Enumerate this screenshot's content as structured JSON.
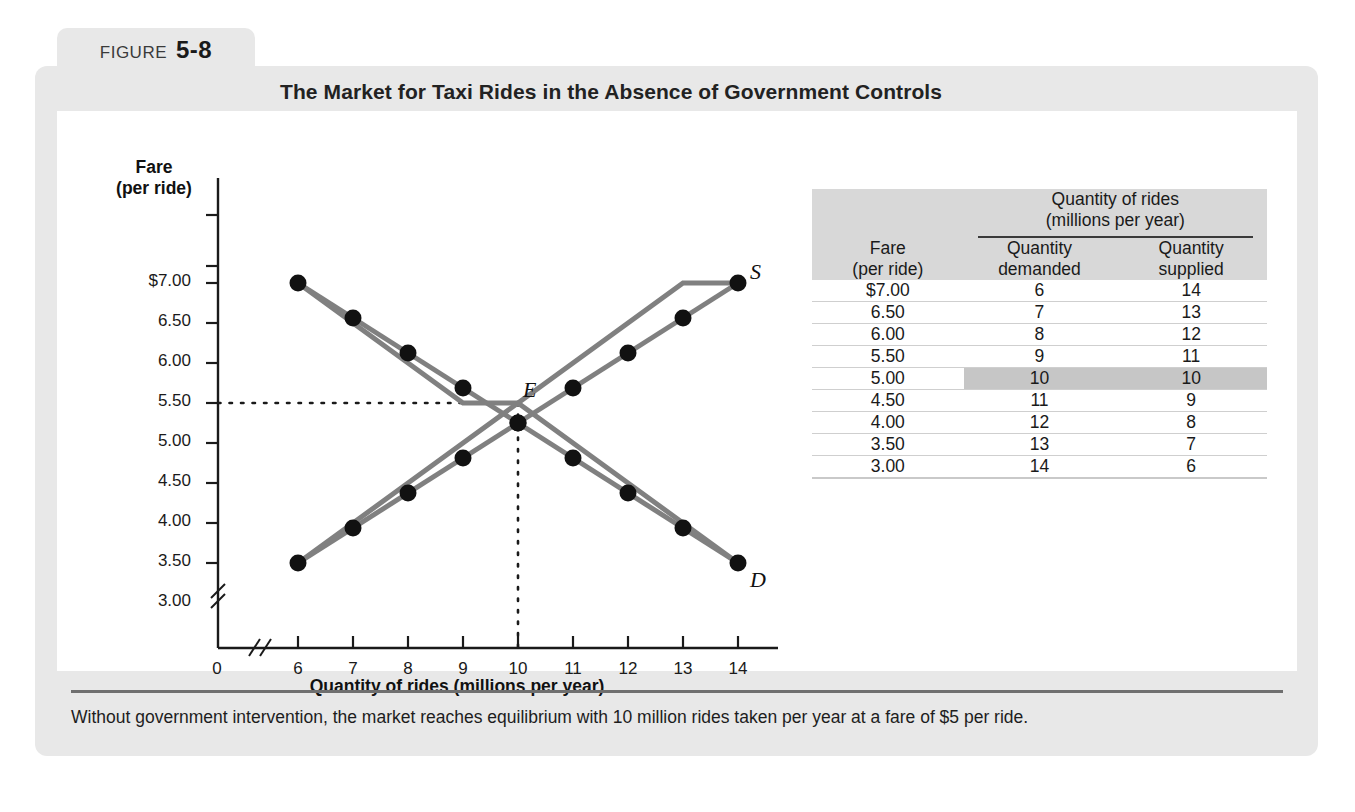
{
  "figure": {
    "label": "FIGURE",
    "number": "5-8",
    "title": "The Market for Taxi Rides in the Absence of Government Controls",
    "caption": "Without government intervention, the market reaches equilibrium with 10 million rides taken per year at a fare of $5 per ride."
  },
  "table": {
    "headers": {
      "fare_line1": "Fare",
      "fare_line2": "(per ride)",
      "group_line1": "Quantity of rides",
      "group_line2": "(millions per year)",
      "demanded_line1": "Quantity",
      "demanded_line2": "demanded",
      "supplied_line1": "Quantity",
      "supplied_line2": "supplied"
    },
    "rows": [
      {
        "fare": "$7.00",
        "demanded": "6",
        "supplied": "14",
        "highlight": false
      },
      {
        "fare": "6.50",
        "demanded": "7",
        "supplied": "13",
        "highlight": false
      },
      {
        "fare": "6.00",
        "demanded": "8",
        "supplied": "12",
        "highlight": false
      },
      {
        "fare": "5.50",
        "demanded": "9",
        "supplied": "11",
        "highlight": false
      },
      {
        "fare": "5.00",
        "demanded": "10",
        "supplied": "10",
        "highlight": true
      },
      {
        "fare": "4.50",
        "demanded": "11",
        "supplied": "9",
        "highlight": false
      },
      {
        "fare": "4.00",
        "demanded": "12",
        "supplied": "8",
        "highlight": false
      },
      {
        "fare": "3.50",
        "demanded": "13",
        "supplied": "7",
        "highlight": false
      },
      {
        "fare": "3.00",
        "demanded": "14",
        "supplied": "6",
        "highlight": false
      }
    ],
    "highlight_color": "#c6c6c6",
    "header_bg": "#d8d8d8"
  },
  "chart_data": {
    "type": "line",
    "title": "The Market for Taxi Rides in the Absence of Government Controls",
    "xlabel": "Quantity of rides (millions per year)",
    "ylabel_line1": "Fare",
    "ylabel_line2": "(per ride)",
    "origin_label": "0",
    "categories": [
      "6",
      "7",
      "8",
      "9",
      "10",
      "11",
      "12",
      "13",
      "14"
    ],
    "x": [
      6,
      7,
      8,
      9,
      10,
      11,
      12,
      13,
      14
    ],
    "ytick_labels": [
      "$7.00",
      "6.50",
      "6.00",
      "5.50",
      "5.00",
      "4.50",
      "4.00",
      "3.50",
      "3.00"
    ],
    "ylim": [
      3.0,
      7.0
    ],
    "xlim": [
      6,
      14
    ],
    "grid": false,
    "axis_break_x": true,
    "axis_break_y": true,
    "legend_position": "inline-curve-labels",
    "series": [
      {
        "name": "Demand",
        "label": "D",
        "color": "#808080",
        "marker_color": "#111111",
        "x": [
          6,
          7,
          8,
          9,
          10,
          11,
          12,
          13,
          14
        ],
        "values": [
          7.0,
          6.5,
          6.0,
          5.5,
          5.0,
          4.5,
          4.0,
          3.5,
          3.0
        ]
      },
      {
        "name": "Supply",
        "label": "S",
        "color": "#808080",
        "marker_color": "#111111",
        "x": [
          6,
          7,
          8,
          9,
          10,
          11,
          12,
          13,
          14
        ],
        "values": [
          3.0,
          3.5,
          4.0,
          4.5,
          5.0,
          5.5,
          6.0,
          6.5,
          7.0
        ]
      }
    ],
    "annotations": {
      "supply": "S",
      "demand": "D",
      "equilibrium": "E",
      "equilibrium_point": {
        "x": 10,
        "y": 5.0
      }
    }
  }
}
